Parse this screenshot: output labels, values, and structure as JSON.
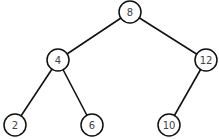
{
  "diagram": {
    "type": "binary-search-tree",
    "nodes": [
      {
        "id": "n8",
        "label": "8",
        "x": 130,
        "y": 12
      },
      {
        "id": "n4",
        "label": "4",
        "x": 58,
        "y": 60
      },
      {
        "id": "n12",
        "label": "12",
        "x": 206,
        "y": 60
      },
      {
        "id": "n2",
        "label": "2",
        "x": 15,
        "y": 125
      },
      {
        "id": "n6",
        "label": "6",
        "x": 92,
        "y": 125
      },
      {
        "id": "n10",
        "label": "10",
        "x": 169,
        "y": 125
      }
    ],
    "edges": [
      {
        "from": "n8",
        "to": "n4"
      },
      {
        "from": "n8",
        "to": "n12"
      },
      {
        "from": "n4",
        "to": "n2"
      },
      {
        "from": "n4",
        "to": "n6"
      },
      {
        "from": "n12",
        "to": "n10"
      }
    ]
  }
}
